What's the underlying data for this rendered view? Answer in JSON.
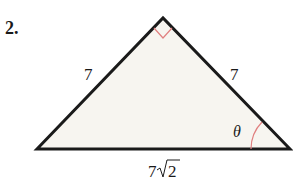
{
  "problem": {
    "number": "2."
  },
  "triangle": {
    "left_side_label": "7",
    "right_side_label": "7",
    "base_label_coef": "7",
    "base_label_radicand": "2",
    "angle_label": "θ",
    "fill_color": "#f7f5f0",
    "stroke_color": "#1a1a1a",
    "marker_color": "#e08080",
    "right_angle_at": "apex"
  }
}
